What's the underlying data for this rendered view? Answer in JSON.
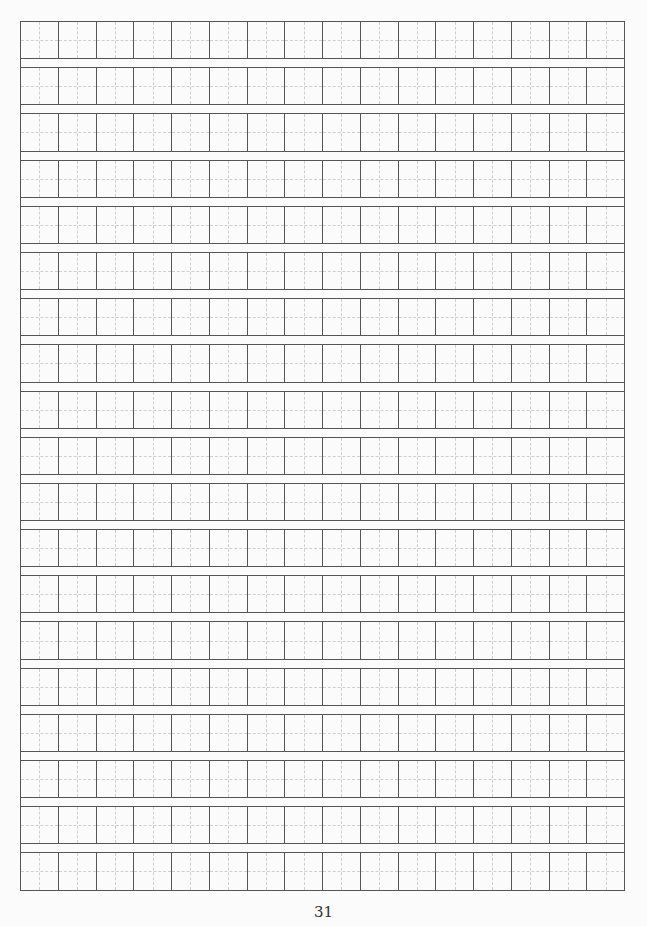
{
  "page": {
    "type": "tianzige-writing-grid",
    "rows": 19,
    "columns": 16,
    "cell_guides": "dashed-cross",
    "colors": {
      "grid_line": "#555555",
      "guide_line": "#cfcfcf",
      "background": "#fbfbfb"
    },
    "page_number": "31"
  }
}
